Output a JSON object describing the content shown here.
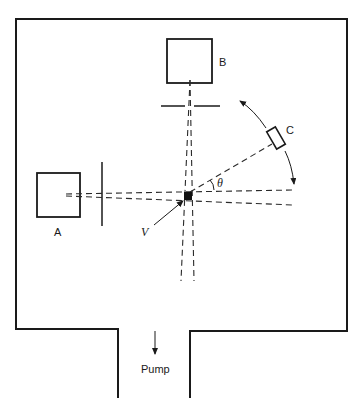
{
  "diagram": {
    "labels": {
      "source_a": "A",
      "source_b": "B",
      "detector": "C",
      "velocity": "V",
      "angle": "θ",
      "pump": "Pump"
    },
    "colors": {
      "line": "#1a1a1a",
      "background": "#ffffff"
    }
  }
}
